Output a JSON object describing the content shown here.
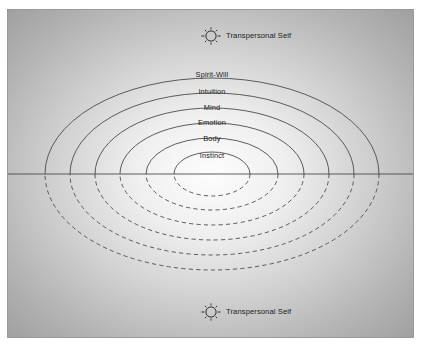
{
  "diagram": {
    "panel": {
      "background_outer_color": "#a0a0a0",
      "background_inner_color": "#fdfdfd",
      "border_color": "#8a8a8a",
      "x": 7,
      "y": 9,
      "width": 407,
      "height": 329
    },
    "center": {
      "x": 212,
      "y": 174
    },
    "axis": {
      "name": "horizontal-midline",
      "y": 174,
      "x1": 8,
      "x2": 413,
      "color": "#4b4b4b"
    },
    "rings": [
      {
        "label": "Spirit-Will",
        "rx": 167,
        "ry": 96,
        "label_y": 75,
        "upper_style": "solid",
        "lower_style": "dashed"
      },
      {
        "label": "Intuition",
        "rx": 142,
        "ry": 81,
        "label_y": 92,
        "upper_style": "solid",
        "lower_style": "dashed"
      },
      {
        "label": "Mind",
        "rx": 117,
        "ry": 66,
        "label_y": 108,
        "upper_style": "solid",
        "lower_style": "dashed"
      },
      {
        "label": "Emotion",
        "rx": 92,
        "ry": 51,
        "label_y": 123,
        "upper_style": "solid",
        "lower_style": "dashed"
      },
      {
        "label": "Body",
        "rx": 66,
        "ry": 36,
        "label_y": 139,
        "upper_style": "solid",
        "lower_style": "dashed"
      },
      {
        "label": "Instinct",
        "rx": 38,
        "ry": 22,
        "label_y": 156,
        "upper_style": "solid",
        "lower_style": "dashed"
      }
    ],
    "markers": [
      {
        "id": "top",
        "icon": "sun-icon",
        "label": "Transpersonal Self",
        "icon_x": 211,
        "icon_y": 36,
        "label_x": 226,
        "label_y": 36
      },
      {
        "id": "bottom",
        "icon": "sun-icon",
        "label": "Transpersonal Self",
        "icon_x": 211,
        "icon_y": 312,
        "label_x": 226,
        "label_y": 312
      }
    ],
    "colors": {
      "stroke": "#4b4b4b",
      "text": "#1a1a1a",
      "icon": "#2e2e2e"
    }
  }
}
